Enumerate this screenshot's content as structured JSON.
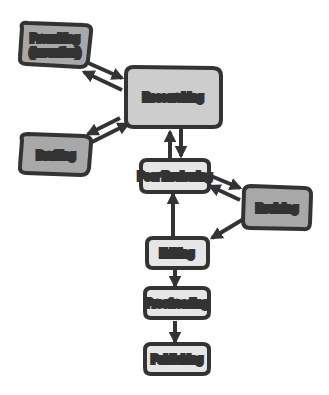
{
  "diagram": {
    "colors": {
      "dark_node_fill": "#a8a8a8",
      "mid_node_fill": "#cdcdcd",
      "light_node_fill": "#e6e6e6",
      "stroke": "#333333",
      "background": "#ffffff"
    },
    "nodes": [
      {
        "id": "prewriting",
        "line1": "Prewriting",
        "line2": "(Invention)"
      },
      {
        "id": "researching",
        "label": "Researching"
      },
      {
        "id": "drafting",
        "label": "Drafting"
      },
      {
        "id": "peer_reviewing",
        "label": "Peer Reviewing"
      },
      {
        "id": "revising",
        "label": "Revising"
      },
      {
        "id": "editing",
        "label": "Editing"
      },
      {
        "id": "proofreading",
        "label": "Proofreading"
      },
      {
        "id": "publishing",
        "label": "Publishing"
      }
    ],
    "edges": [
      {
        "from": "prewriting",
        "to": "researching"
      },
      {
        "from": "researching",
        "to": "prewriting"
      },
      {
        "from": "drafting",
        "to": "researching"
      },
      {
        "from": "researching",
        "to": "drafting"
      },
      {
        "from": "researching",
        "to": "peer_reviewing"
      },
      {
        "from": "peer_reviewing",
        "to": "researching"
      },
      {
        "from": "peer_reviewing",
        "to": "revising"
      },
      {
        "from": "revising",
        "to": "peer_reviewing"
      },
      {
        "from": "revising",
        "to": "editing"
      },
      {
        "from": "editing",
        "to": "peer_reviewing"
      },
      {
        "from": "editing",
        "to": "proofreading"
      },
      {
        "from": "proofreading",
        "to": "publishing"
      }
    ]
  }
}
